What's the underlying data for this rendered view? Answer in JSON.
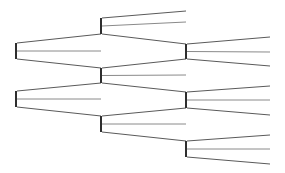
{
  "diagram": {
    "type": "tree",
    "colors": {
      "edge_outer": "#5a5a5a",
      "edge_middle": "#8a8a8a",
      "node_bar": "#2e2e2e",
      "background": "#ffffff"
    },
    "nodes": [
      {
        "id": "r1",
        "level": 0,
        "children": [
          "a1",
          "m1",
          "a2"
        ]
      },
      {
        "id": "r2",
        "level": 0,
        "children": [
          "a2b",
          "m2",
          "a3"
        ]
      },
      {
        "id": "a1",
        "level": 1,
        "children": [
          "l1",
          "l2",
          "b1"
        ]
      },
      {
        "id": "a2",
        "level": 1,
        "children": [
          "b1b",
          "l3",
          "b2"
        ]
      },
      {
        "id": "a3",
        "level": 1,
        "children": [
          "b2b",
          "l4",
          "b3"
        ]
      },
      {
        "id": "b1",
        "level": 2,
        "children": [
          "t1",
          "t2",
          "t3"
        ]
      },
      {
        "id": "b2",
        "level": 2,
        "children": [
          "t4",
          "t5",
          "t6"
        ]
      },
      {
        "id": "b3",
        "level": 2,
        "children": [
          "t7",
          "t8",
          "t9"
        ]
      }
    ],
    "levels": 3,
    "branching_factor": 3
  }
}
